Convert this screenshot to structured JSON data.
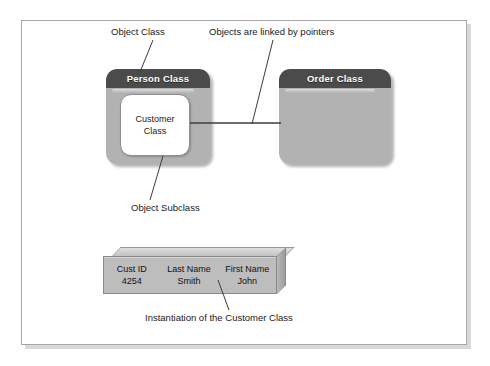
{
  "diagram": {
    "classes": [
      {
        "id": "person",
        "header": "Person Class",
        "subclass_line1": "Customer",
        "subclass_line2": "Class"
      },
      {
        "id": "order",
        "header": "Order Class",
        "subclass_line1": "",
        "subclass_line2": ""
      }
    ],
    "annotations": [
      {
        "id": "object-class",
        "text": "Object Class"
      },
      {
        "id": "pointers",
        "text": "Objects are linked by pointers"
      },
      {
        "id": "object-subclass",
        "text": "Object Subclass"
      },
      {
        "id": "instantiation",
        "text": "Instantiation of the Customer Class"
      }
    ],
    "instance_table": {
      "headers": [
        "Cust ID",
        "Last Name",
        "First Name"
      ],
      "rows": [
        [
          "4254",
          "Smith",
          "John"
        ]
      ]
    },
    "colors": {
      "header_bar": "#4b4b4b",
      "class_body": "#b2b2b2",
      "subclass_fill": "#ffffff",
      "table_face": "#bdbdbd",
      "frame_border": "#a8a8a8",
      "leader_line": "#3c3c3c",
      "text": "#1a1a1a",
      "header_text": "#ffffff"
    }
  }
}
